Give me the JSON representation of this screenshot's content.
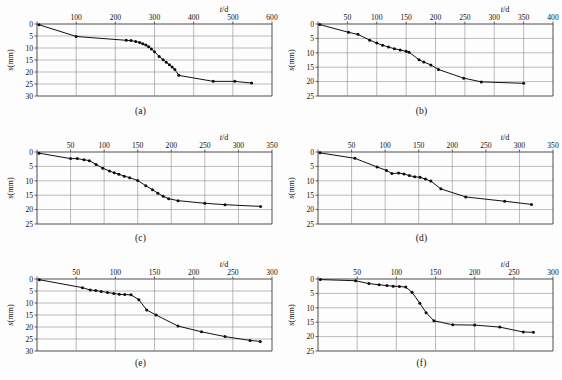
{
  "figure": {
    "name": "settlement-vs-time-curves",
    "background_color": "#fdfdfd",
    "line_color": "#111111",
    "grid_color": "#8d8d8d",
    "axis_color": "#3a3a3a",
    "panel_count": 6
  },
  "common": {
    "xlabel": "t/d",
    "xlabel_italic_part": "t",
    "xlabel_rest": "/d",
    "ylabel": "s(mm)",
    "ylabel_italic_part": "s",
    "ylabel_rest": "(mm)"
  },
  "captions": {
    "a": "(a)",
    "b": "(b)",
    "c": "(c)",
    "d": "(d)",
    "e": "(e)",
    "f": "(f)"
  },
  "chart_data": [
    {
      "id": "a",
      "type": "line",
      "caption": "(a)",
      "title": "",
      "xlabel": "t/d",
      "ylabel": "s(mm)",
      "xlim": [
        0,
        600
      ],
      "ylim": [
        0,
        30
      ],
      "y_inverted": true,
      "grid": true,
      "xticks": [
        0,
        100,
        200,
        300,
        400,
        500,
        600
      ],
      "xtick_labels": [
        "",
        "100",
        "200",
        "300",
        "400",
        "500",
        "600"
      ],
      "yticks": [
        0,
        5,
        10,
        15,
        20,
        25,
        30
      ],
      "ytick_labels": [
        "0",
        "5",
        "10",
        "15",
        "20",
        "25",
        "30"
      ],
      "x": [
        5,
        100,
        228,
        240,
        252,
        262,
        270,
        278,
        285,
        292,
        300,
        312,
        322,
        330,
        338,
        345,
        352,
        362,
        450,
        505,
        548
      ],
      "y": [
        0.3,
        5.2,
        6.8,
        6.9,
        7.3,
        7.7,
        8.2,
        8.8,
        9.5,
        10.4,
        11.6,
        13.5,
        14.9,
        15.9,
        17.0,
        17.9,
        19.0,
        21.4,
        23.9,
        23.9,
        24.6
      ]
    },
    {
      "id": "b",
      "type": "line",
      "caption": "(b)",
      "title": "",
      "xlabel": "t/d",
      "ylabel": "s(mm)",
      "xlim": [
        0,
        400
      ],
      "ylim": [
        0,
        25
      ],
      "y_inverted": true,
      "grid": true,
      "xticks": [
        0,
        50,
        100,
        150,
        200,
        250,
        300,
        350,
        400
      ],
      "xtick_labels": [
        "",
        "50",
        "100",
        "150",
        "200",
        "250",
        "300",
        "350",
        "400"
      ],
      "yticks": [
        0,
        5,
        10,
        15,
        20,
        25
      ],
      "ytick_labels": [
        "0",
        "5",
        "10",
        "15",
        "20",
        "25"
      ],
      "x": [
        3,
        52,
        68,
        88,
        100,
        110,
        120,
        130,
        140,
        150,
        155,
        172,
        180,
        192,
        205,
        248,
        278,
        350
      ],
      "y": [
        0.2,
        2.9,
        3.6,
        5.6,
        6.6,
        7.4,
        8.0,
        8.6,
        9.0,
        9.5,
        9.8,
        12.4,
        13.2,
        14.2,
        15.8,
        18.8,
        20.1,
        20.6
      ]
    },
    {
      "id": "c",
      "type": "line",
      "caption": "(c)",
      "title": "",
      "xlabel": "t/d",
      "ylabel": "s(mm)",
      "xlim": [
        0,
        350
      ],
      "ylim": [
        0,
        25
      ],
      "y_inverted": true,
      "grid": true,
      "xticks": [
        0,
        50,
        100,
        150,
        200,
        250,
        300,
        350
      ],
      "xtick_labels": [
        "",
        "50",
        "100",
        "150",
        "200",
        "250",
        "300",
        "350"
      ],
      "yticks": [
        0,
        5,
        10,
        15,
        20,
        25
      ],
      "ytick_labels": [
        "0",
        "5",
        "10",
        "15",
        "20",
        "25"
      ],
      "x": [
        3,
        50,
        60,
        70,
        78,
        88,
        98,
        108,
        115,
        122,
        130,
        138,
        150,
        162,
        172,
        180,
        188,
        196,
        210,
        250,
        280,
        333
      ],
      "y": [
        0.4,
        2.3,
        2.3,
        2.7,
        3.0,
        4.3,
        5.6,
        6.6,
        7.2,
        7.7,
        8.4,
        8.9,
        9.9,
        11.7,
        13.1,
        14.3,
        15.4,
        16.2,
        16.9,
        17.8,
        18.3,
        18.9
      ]
    },
    {
      "id": "d",
      "type": "line",
      "caption": "(d)",
      "title": "",
      "xlabel": "t/d",
      "ylabel": "s(mm)",
      "xlim": [
        0,
        350
      ],
      "ylim": [
        0,
        25
      ],
      "y_inverted": true,
      "grid": true,
      "xticks": [
        0,
        50,
        100,
        150,
        200,
        250,
        300,
        350
      ],
      "xtick_labels": [
        "",
        "50",
        "100",
        "150",
        "200",
        "250",
        "300",
        "350"
      ],
      "yticks": [
        0,
        5,
        10,
        15,
        20,
        25
      ],
      "ytick_labels": [
        "0",
        "5",
        "10",
        "15",
        "20",
        "25"
      ],
      "x": [
        3,
        55,
        88,
        102,
        110,
        120,
        128,
        136,
        144,
        152,
        160,
        168,
        183,
        220,
        278,
        318
      ],
      "y": [
        0.3,
        2.2,
        5.2,
        6.4,
        7.5,
        7.3,
        7.6,
        8.2,
        8.6,
        8.8,
        9.4,
        10.1,
        12.8,
        15.6,
        17.1,
        18.2
      ]
    },
    {
      "id": "e",
      "type": "line",
      "caption": "(e)",
      "title": "",
      "xlabel": "t/d",
      "ylabel": "s(mm)",
      "xlim": [
        0,
        300
      ],
      "ylim": [
        0,
        30
      ],
      "y_inverted": true,
      "grid": true,
      "xticks": [
        0,
        50,
        100,
        150,
        200,
        250,
        300
      ],
      "xtick_labels": [
        "",
        "50",
        "100",
        "150",
        "200",
        "250",
        "300"
      ],
      "yticks": [
        0,
        5,
        10,
        15,
        20,
        25,
        30
      ],
      "ytick_labels": [
        "0",
        "5",
        "10",
        "15",
        "20",
        "25",
        "30"
      ],
      "x": [
        3,
        58,
        68,
        75,
        82,
        90,
        98,
        105,
        112,
        120,
        130,
        140,
        152,
        180,
        210,
        240,
        272,
        285
      ],
      "y": [
        0.3,
        3.6,
        4.6,
        4.8,
        5.2,
        5.6,
        6.0,
        6.4,
        6.5,
        6.6,
        8.6,
        12.9,
        15.0,
        19.6,
        22.0,
        24.0,
        25.6,
        26.0
      ]
    },
    {
      "id": "f",
      "type": "line",
      "caption": "(f)",
      "title": "",
      "xlabel": "t/d",
      "ylabel": "s(mm)",
      "xlim": [
        0,
        300
      ],
      "ylim": [
        0,
        25
      ],
      "y_inverted": true,
      "grid": true,
      "xticks": [
        0,
        50,
        100,
        150,
        200,
        250,
        300
      ],
      "xtick_labels": [
        "",
        "50",
        "100",
        "150",
        "200",
        "250",
        "300"
      ],
      "yticks": [
        0,
        5,
        10,
        15,
        20,
        25
      ],
      "ytick_labels": [
        "0",
        "5",
        "10",
        "15",
        "20",
        "25"
      ],
      "x": [
        3,
        48,
        65,
        78,
        88,
        96,
        104,
        112,
        120,
        130,
        138,
        148,
        172,
        200,
        232,
        262,
        275
      ],
      "y": [
        0.2,
        0.6,
        1.6,
        2.0,
        2.3,
        2.5,
        2.6,
        2.8,
        4.6,
        8.4,
        11.7,
        14.5,
        15.9,
        16.0,
        16.7,
        18.4,
        18.5
      ]
    }
  ]
}
